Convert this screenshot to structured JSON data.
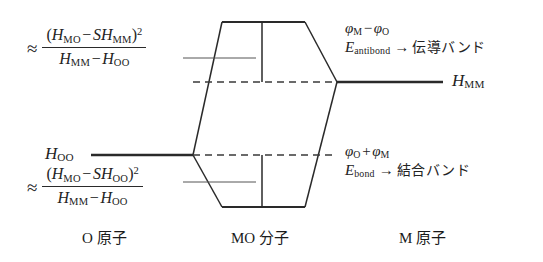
{
  "figure": {
    "type": "molecular-orbital-energy-diagram",
    "background_color": "#ffffff",
    "line_color": "#2a2a2a"
  },
  "left_column": {
    "caption": "O 原子",
    "level_label": "H",
    "level_label_sub": "OO",
    "formula_antibond": {
      "approx_sign": "≈",
      "numerator_open": "(",
      "numerator_h1": "H",
      "numerator_h1_sub": "MO",
      "numerator_minus": "−",
      "numerator_s": "S",
      "numerator_h2": "H",
      "numerator_h2_sub": "MM",
      "numerator_close": ")",
      "numerator_power": "2",
      "denominator_h1": "H",
      "denominator_h1_sub": "MM",
      "denominator_minus": "−",
      "denominator_h2": "H",
      "denominator_h2_sub": "OO"
    },
    "formula_bond": {
      "approx_sign": "≈",
      "numerator_open": "(",
      "numerator_h1": "H",
      "numerator_h1_sub": "MO",
      "numerator_minus": "−",
      "numerator_s": "S",
      "numerator_h2": "H",
      "numerator_h2_sub": "OO",
      "numerator_close": ")",
      "numerator_power": "2",
      "denominator_h1": "H",
      "denominator_h1_sub": "MM",
      "denominator_minus": "−",
      "denominator_h2": "H",
      "denominator_h2_sub": "OO"
    }
  },
  "center_column": {
    "caption": "MO 分子"
  },
  "right_column": {
    "caption": "M 原子",
    "level_label": "H",
    "level_label_sub": "MM",
    "antibond_annotation": {
      "wavefunction_phi1": "φ",
      "wavefunction_phi1_sub": "M",
      "wavefunction_operator": "−",
      "wavefunction_phi2": "φ",
      "wavefunction_phi2_sub": "O",
      "energy_symbol": "E",
      "energy_sub": "antibond",
      "arrow": "→",
      "band_name": "伝導バンド"
    },
    "bond_annotation": {
      "wavefunction_phi1": "φ",
      "wavefunction_phi1_sub": "O",
      "wavefunction_operator": "+",
      "wavefunction_phi2": "φ",
      "wavefunction_phi2_sub": "M",
      "energy_symbol": "E",
      "energy_sub": "bond",
      "arrow": "→",
      "band_name": "結合バンド"
    }
  }
}
